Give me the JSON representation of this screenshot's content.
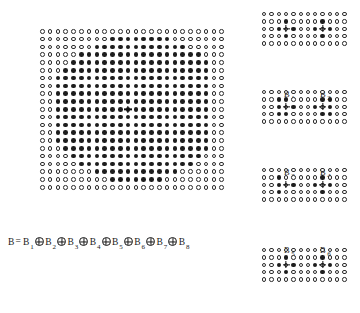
{
  "figure": {
    "type": "lattice-decomposition-diagram",
    "caption_formula": {
      "lhs": "B",
      "equals": "=",
      "operator": "⊕",
      "operator_name": "minkowski-sum-oplus",
      "terms": [
        {
          "base": "B",
          "sub": "1"
        },
        {
          "base": "B",
          "sub": "2"
        },
        {
          "base": "B",
          "sub": "3"
        },
        {
          "base": "B",
          "sub": "4"
        },
        {
          "base": "B",
          "sub": "5"
        },
        {
          "base": "B",
          "sub": "6"
        },
        {
          "base": "B",
          "sub": "7"
        },
        {
          "base": "B",
          "sub": "8"
        }
      ]
    },
    "colors": {
      "filled_dot": "#1d1d1d",
      "open_dot_stroke": "#2b2b2b",
      "background": "#ffffff",
      "text": "#1a1a1a"
    },
    "main": {
      "name": "composite-structuring-element",
      "cols": 24,
      "rows": 21,
      "spacing": 7.8,
      "dot_size": 4.6,
      "origin_marker": "cross",
      "origin_col": 11,
      "origin_row": 10,
      "shape": "hexagon",
      "row_fill_spans": [
        [
          -1,
          -1
        ],
        [
          9,
          16
        ],
        [
          7,
          18
        ],
        [
          5,
          20
        ],
        [
          4,
          21
        ],
        [
          3,
          21
        ],
        [
          2,
          21
        ],
        [
          2,
          21
        ],
        [
          2,
          21
        ],
        [
          2,
          21
        ],
        [
          2,
          21
        ],
        [
          2,
          21
        ],
        [
          2,
          21
        ],
        [
          2,
          21
        ],
        [
          2,
          21
        ],
        [
          3,
          21
        ],
        [
          4,
          20
        ],
        [
          5,
          19
        ],
        [
          7,
          17
        ],
        [
          9,
          15
        ],
        [
          -1,
          -1
        ]
      ]
    },
    "panels": [
      {
        "name": "panel-b1-b2",
        "cols": 12,
        "rows": 5,
        "spacing": 7.3,
        "dot_size": 4.4,
        "clusters": [
          {
            "label_base": "B",
            "label_sub": "1",
            "origin_col": 3,
            "origin_row": 2,
            "filled_cells": [
              [
                3,
                1
              ],
              [
                2,
                2
              ],
              [
                4,
                2
              ],
              [
                3,
                3
              ]
            ],
            "label_x": 22,
            "label_y": 40
          },
          {
            "label_base": "B",
            "label_sub": "2",
            "origin_col": 8,
            "origin_row": 2,
            "filled_cells": [
              [
                8,
                1
              ],
              [
                7,
                2
              ],
              [
                9,
                2
              ],
              [
                8,
                3
              ]
            ],
            "label_x": 58,
            "label_y": 40
          }
        ]
      },
      {
        "name": "panel-b3-b4",
        "cols": 12,
        "rows": 5,
        "spacing": 7.3,
        "dot_size": 4.4,
        "clusters": [
          {
            "label_base": "B",
            "label_sub": "3",
            "origin_col": 3,
            "origin_row": 2,
            "filled_cells": [
              [
                2,
                1
              ],
              [
                3,
                1
              ],
              [
                2,
                2
              ],
              [
                4,
                2
              ],
              [
                2,
                3
              ],
              [
                3,
                3
              ]
            ],
            "label_x": 22,
            "label_y": 40
          },
          {
            "label_base": "B",
            "label_sub": "4",
            "origin_col": 8,
            "origin_row": 2,
            "filled_cells": [
              [
                8,
                1
              ],
              [
                9,
                1
              ],
              [
                7,
                2
              ],
              [
                9,
                2
              ],
              [
                8,
                3
              ],
              [
                9,
                3
              ]
            ],
            "label_x": 58,
            "label_y": 40
          }
        ]
      },
      {
        "name": "panel-b5-b6",
        "cols": 12,
        "rows": 5,
        "spacing": 7.3,
        "dot_size": 4.4,
        "clusters": [
          {
            "label_base": "B",
            "label_sub": "5",
            "origin_col": 3,
            "origin_row": 2,
            "filled_cells": [
              [
                2,
                1
              ],
              [
                2,
                2
              ],
              [
                4,
                2
              ],
              [
                2,
                3
              ]
            ],
            "label_x": 22,
            "label_y": 40
          },
          {
            "label_base": "B",
            "label_sub": "6",
            "origin_col": 8,
            "origin_row": 2,
            "filled_cells": [
              [
                8,
                1
              ],
              [
                7,
                2
              ],
              [
                9,
                2
              ],
              [
                8,
                3
              ]
            ],
            "label_x": 58,
            "label_y": 40
          }
        ]
      },
      {
        "name": "panel-b7-b8",
        "cols": 12,
        "rows": 5,
        "spacing": 7.3,
        "dot_size": 4.4,
        "clusters": [
          {
            "label_base": "B",
            "label_sub": "7",
            "origin_col": 3,
            "origin_row": 2,
            "filled_cells": [
              [
                3,
                1
              ],
              [
                2,
                2
              ],
              [
                4,
                2
              ],
              [
                3,
                3
              ]
            ],
            "label_x": 22,
            "label_y": 40
          },
          {
            "label_base": "B",
            "label_sub": "8",
            "origin_col": 8,
            "origin_row": 2,
            "filled_cells": [
              [
                8,
                1
              ],
              [
                7,
                2
              ],
              [
                9,
                2
              ],
              [
                8,
                3
              ]
            ],
            "label_x": 58,
            "label_y": 40
          }
        ]
      }
    ],
    "panel_positions": [
      {
        "x": 262,
        "y": 12
      },
      {
        "x": 262,
        "y": 90
      },
      {
        "x": 262,
        "y": 168
      },
      {
        "x": 262,
        "y": 248
      }
    ]
  }
}
